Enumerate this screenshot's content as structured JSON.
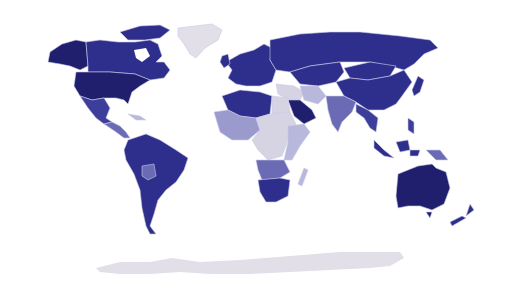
{
  "map": {
    "type": "choropleth-world-map",
    "projection": "equirectangular-like",
    "legend": null,
    "title": null,
    "palette": {
      "darkest": "#1f1f6e",
      "dark": "#2e2e8c",
      "medium_dark": "#3d3d9a",
      "medium": "#6b6bb5",
      "light": "#9a9acd",
      "lighter": "#b8b8dc",
      "lightest": "#d6d3e3",
      "no_data": "#e2dfe8",
      "border": "#c9c9e8",
      "background": "#ffffff"
    },
    "regions": [
      {
        "name": "Alaska",
        "shade": "darkest"
      },
      {
        "name": "Canada",
        "shade": "dark"
      },
      {
        "name": "United States",
        "shade": "darkest"
      },
      {
        "name": "Greenland",
        "shade": "no_data"
      },
      {
        "name": "Mexico",
        "shade": "medium_dark"
      },
      {
        "name": "Central America",
        "shade": "medium"
      },
      {
        "name": "Caribbean",
        "shade": "lighter"
      },
      {
        "name": "South America",
        "shade": "dark"
      },
      {
        "name": "Bolivia",
        "shade": "medium"
      },
      {
        "name": "Europe",
        "shade": "dark"
      },
      {
        "name": "Russia",
        "shade": "dark"
      },
      {
        "name": "Kazakhstan / Central Asia",
        "shade": "dark"
      },
      {
        "name": "Mongolia",
        "shade": "dark"
      },
      {
        "name": "China",
        "shade": "dark"
      },
      {
        "name": "Japan",
        "shade": "dark"
      },
      {
        "name": "Middle East",
        "shade": "lightest"
      },
      {
        "name": "Saudi Arabia",
        "shade": "darkest"
      },
      {
        "name": "Iran",
        "shade": "lighter"
      },
      {
        "name": "India",
        "shade": "medium"
      },
      {
        "name": "Southeast Asia",
        "shade": "medium_dark"
      },
      {
        "name": "Indonesia",
        "shade": "dark"
      },
      {
        "name": "Papua New Guinea",
        "shade": "medium"
      },
      {
        "name": "Australia",
        "shade": "darkest"
      },
      {
        "name": "New Zealand",
        "shade": "dark"
      },
      {
        "name": "North Africa (Algeria, Libya)",
        "shade": "dark"
      },
      {
        "name": "Egypt",
        "shade": "lightest"
      },
      {
        "name": "West Africa",
        "shade": "light"
      },
      {
        "name": "Central Africa",
        "shade": "lightest"
      },
      {
        "name": "East Africa",
        "shade": "lighter"
      },
      {
        "name": "Angola / Zambia",
        "shade": "medium"
      },
      {
        "name": "Southern Africa",
        "shade": "dark"
      },
      {
        "name": "Madagascar",
        "shade": "lighter"
      },
      {
        "name": "Antarctica",
        "shade": "no_data"
      }
    ]
  }
}
